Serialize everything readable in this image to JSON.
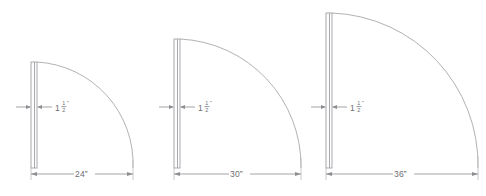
{
  "drawing": {
    "title": "Door Swing Clearance Diagrams",
    "line_color": "#a9a9ad",
    "text_color": "#6d6d71",
    "background_color": "#ffffff",
    "units": "inches"
  },
  "thickness_label": {
    "whole": "1",
    "numerator": "1",
    "denominator": "2",
    "inch_mark": "”",
    "full_text": "1 1/2\""
  },
  "figures": [
    {
      "id": "figure-24",
      "name": "door-swing-24-inch",
      "width_label": "24”",
      "width_value": 24,
      "thickness_label": "1 1/2\"",
      "thickness_value": 1.5,
      "panel_x": 31,
      "panel_y": 62,
      "panel_width": 6,
      "panel_height": 106,
      "arc_radius": 102,
      "dim_line_y": 174,
      "dim_left_x": 31,
      "dim_right_x": 133,
      "leader_y": 107
    },
    {
      "id": "figure-30",
      "name": "door-swing-30-inch",
      "width_label": "30”",
      "width_value": 30,
      "thickness_label": "1 1/2\"",
      "thickness_value": 1.5,
      "panel_x": 174,
      "panel_y": 39,
      "panel_width": 6,
      "panel_height": 129,
      "arc_radius": 127,
      "dim_line_y": 174,
      "dim_left_x": 174,
      "dim_right_x": 301,
      "leader_y": 107
    },
    {
      "id": "figure-36",
      "name": "door-swing-36-inch",
      "width_label": "36”",
      "width_value": 36,
      "thickness_label": "1 1/2\"",
      "thickness_value": 1.5,
      "panel_x": 326,
      "panel_y": 13,
      "panel_width": 6,
      "panel_height": 155,
      "arc_radius": 152,
      "dim_line_y": 174,
      "dim_left_x": 326,
      "dim_right_x": 478,
      "leader_y": 107
    }
  ]
}
